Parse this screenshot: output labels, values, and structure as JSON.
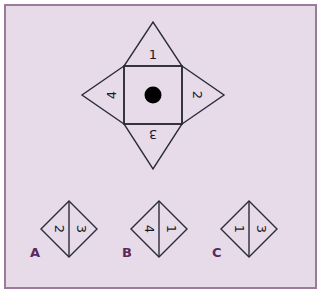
{
  "canvas": {
    "width": 321,
    "height": 293,
    "background_color": "#ffffff",
    "panel_color": "#e7dbe9",
    "border_color": "#9b7a9b",
    "line_color": "#2b2b3a",
    "label_color": "#5b2a5b",
    "dot_color": "#000000"
  },
  "main_figure": {
    "name": "unfolded-net-with-dot",
    "center_square": {
      "dot_label": "dot-marker"
    },
    "flaps": [
      {
        "position": "top",
        "value": "1",
        "rotation_deg": 0
      },
      {
        "position": "right",
        "value": "2",
        "rotation_deg": 90
      },
      {
        "position": "bottom",
        "value": "3",
        "rotation_deg": 180
      },
      {
        "position": "left",
        "value": "4",
        "rotation_deg": 270
      }
    ]
  },
  "options": [
    {
      "label": "A",
      "name": "option-a",
      "left_value": "2",
      "left_rotation_deg": 90,
      "right_value": "3",
      "right_rotation_deg": 90
    },
    {
      "label": "B",
      "name": "option-b",
      "left_value": "4",
      "left_rotation_deg": 90,
      "right_value": "1",
      "right_rotation_deg": 90
    },
    {
      "label": "C",
      "name": "option-c",
      "left_value": "1",
      "left_rotation_deg": 90,
      "right_value": "3",
      "right_rotation_deg": 90
    }
  ]
}
